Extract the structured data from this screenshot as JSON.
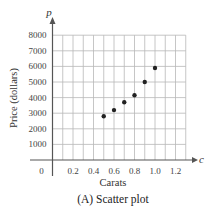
{
  "chart_data": {
    "type": "scatter",
    "title": "",
    "caption": "(A) Scatter plot",
    "xlabel": "Carats",
    "ylabel": "Price (dollars)",
    "x_var": "c",
    "y_var": "p",
    "xlim": [
      0,
      1.3
    ],
    "ylim": [
      0,
      8000
    ],
    "x_ticks": [
      0.2,
      0.4,
      0.6,
      0.8,
      1.0,
      1.2
    ],
    "x_tick_labels": [
      "0.2",
      "0.4",
      "0.6",
      "0.8",
      "1.0",
      "1.2"
    ],
    "y_ticks": [
      1000,
      2000,
      3000,
      4000,
      5000,
      6000,
      7000,
      8000
    ],
    "y_tick_labels": [
      "1000",
      "2000",
      "3000",
      "4000",
      "5000",
      "6000",
      "7000",
      "8000"
    ],
    "origin_label": "0",
    "grid": true,
    "x_grid_step": 0.1,
    "y_grid_step": 1000,
    "legend": null,
    "points": [
      {
        "x": 0.5,
        "y": 2800
      },
      {
        "x": 0.6,
        "y": 3200
      },
      {
        "x": 0.7,
        "y": 3700
      },
      {
        "x": 0.8,
        "y": 4150
      },
      {
        "x": 0.9,
        "y": 5000
      },
      {
        "x": 1.0,
        "y": 5900
      }
    ],
    "colors": {
      "grid": "#b8b8b8",
      "axis": "#555555",
      "point": "#222222"
    }
  }
}
